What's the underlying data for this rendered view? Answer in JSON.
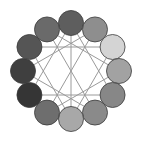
{
  "diagram": {
    "type": "circular-node-graph",
    "center": [
      71,
      71
    ],
    "ring_radius": 48,
    "node_radius": 12.5,
    "edge_color": "#9a9a9a",
    "node_stroke": "#3a3a3a",
    "nodes": [
      {
        "id": "n0",
        "angle": -90,
        "fill": "#5e5e5e"
      },
      {
        "id": "n1",
        "angle": -60,
        "fill": "#8e8e8e"
      },
      {
        "id": "n2",
        "angle": -30,
        "fill": "#d4d4d4"
      },
      {
        "id": "n3",
        "angle": 0,
        "fill": "#a2a2a2"
      },
      {
        "id": "n4",
        "angle": 30,
        "fill": "#878787"
      },
      {
        "id": "n5",
        "angle": 60,
        "fill": "#8a8a8a"
      },
      {
        "id": "n6",
        "angle": 90,
        "fill": "#a8a8a8"
      },
      {
        "id": "n7",
        "angle": 120,
        "fill": "#6e6e6e"
      },
      {
        "id": "n8",
        "angle": 150,
        "fill": "#353535"
      },
      {
        "id": "n9",
        "angle": 180,
        "fill": "#3f3f3f"
      },
      {
        "id": "n10",
        "angle": 210,
        "fill": "#555555"
      },
      {
        "id": "n11",
        "angle": 240,
        "fill": "#6a6a6a"
      }
    ],
    "edges": [
      [
        "n0",
        "n6"
      ],
      [
        "n2",
        "n10"
      ],
      [
        "n4",
        "n8"
      ],
      [
        "n0",
        "n4"
      ],
      [
        "n4",
        "n8"
      ],
      [
        "n8",
        "n0"
      ],
      [
        "n2",
        "n6"
      ],
      [
        "n6",
        "n10"
      ],
      [
        "n10",
        "n2"
      ],
      [
        "n1",
        "n7"
      ],
      [
        "n5",
        "n11"
      ],
      [
        "n1",
        "n9"
      ],
      [
        "n3",
        "n11"
      ],
      [
        "n3",
        "n7"
      ],
      [
        "n5",
        "n9"
      ]
    ]
  }
}
